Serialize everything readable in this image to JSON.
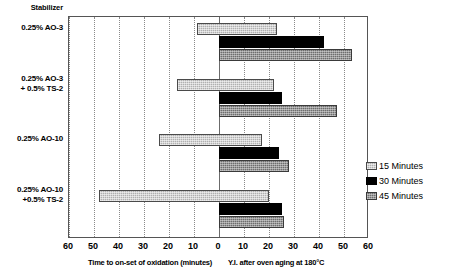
{
  "category_header": "Stabilizer",
  "axis": {
    "left_title": "Time to on-set of oxidation (minutes)",
    "right_title": "Y.I. after oven aging at 180°C",
    "ticks": [
      "60",
      "50",
      "40",
      "30",
      "20",
      "10",
      "0",
      "10",
      "20",
      "30",
      "40",
      "50",
      "60"
    ]
  },
  "legend": {
    "items": [
      {
        "label": "15 Minutes",
        "color": "#b0b0b0"
      },
      {
        "label": "30 Minutes",
        "color": "#000000"
      },
      {
        "label": "45 Minutes",
        "color": "#6e6e6e"
      }
    ]
  },
  "chart_data": {
    "type": "bar",
    "title": "",
    "orientation": "horizontal",
    "diverging": true,
    "xlabel_left": "Time to on-set of oxidation (minutes)",
    "xlabel_right": "Y.I. after oven aging at 180°C",
    "ylabel": "Stabilizer",
    "xlim": [
      -60,
      60
    ],
    "xticks": [
      -60,
      -50,
      -40,
      -30,
      -20,
      -10,
      0,
      10,
      20,
      30,
      40,
      50,
      60
    ],
    "xtick_labels": [
      "60",
      "50",
      "40",
      "30",
      "20",
      "10",
      "0",
      "10",
      "20",
      "30",
      "40",
      "50",
      "60"
    ],
    "grid": true,
    "legend_position": "right",
    "categories": [
      "0.25% AO-3",
      "0.25% AO-3\n+ 0.5% TS-2",
      "0.25% AO-10",
      "0.25% AO-10\n+0.5% TS-2"
    ],
    "series": [
      {
        "name": "15 Minutes",
        "color": "#b0b0b0",
        "oxidation_time_minutes": [
          9,
          17,
          24,
          48
        ],
        "yellowness_index": [
          23,
          22,
          17,
          20
        ]
      },
      {
        "name": "30 Minutes",
        "color": "#000000",
        "oxidation_time_minutes": [
          0,
          0,
          0,
          0
        ],
        "yellowness_index": [
          42,
          25,
          24,
          25
        ]
      },
      {
        "name": "45 Minutes",
        "color": "#6e6e6e",
        "oxidation_time_minutes": [
          0,
          0,
          0,
          0
        ],
        "yellowness_index": [
          53,
          47,
          28,
          26
        ]
      }
    ]
  }
}
